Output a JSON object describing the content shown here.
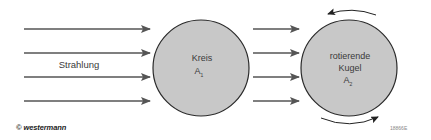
{
  "diagram": {
    "radiation_label": "Strahlung",
    "circle_1": {
      "line1": "Kreis",
      "symbol": "A",
      "subscript": "1"
    },
    "circle_2": {
      "line1": "rotierende",
      "line2": "Kugel",
      "symbol": "A",
      "subscript": "2"
    },
    "colors": {
      "arrow": "#555555",
      "circle_fill": "#c8c8c8",
      "circle_stroke": "#2a2a2a",
      "text": "#3a3a3a"
    }
  },
  "footer": {
    "copyright": "© westermann",
    "figure_id": "18866E"
  }
}
